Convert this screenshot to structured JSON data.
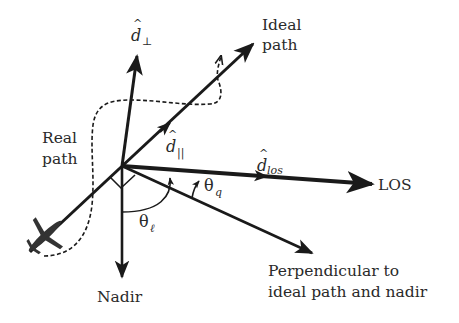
{
  "diagram": {
    "colors": {
      "stroke": "#1a1a1a",
      "text": "#2a2a2a",
      "background": "#ffffff"
    },
    "labels": {
      "ideal_path_line1": "Ideal",
      "ideal_path_line2": "path",
      "real_path_line1": "Real",
      "real_path_line2": "path",
      "d_perp_base": "d",
      "d_perp_hat": "^",
      "d_perp_sub": "⊥",
      "d_par_base": "d",
      "d_par_hat": "^",
      "d_par_sub": "||",
      "d_los_base": "d",
      "d_los_hat": "^",
      "d_los_sub": "los",
      "los": "LOS",
      "theta_q_base": "θ",
      "theta_q_sub": "q",
      "theta_l_base": "θ",
      "theta_l_sub": "ℓ",
      "nadir": "Nadir",
      "perpendicular_line1": "Perpendicular to",
      "perpendicular_line2": "ideal path and nadir"
    },
    "elements": [
      {
        "id": "ideal-path-arrow",
        "type": "arrow",
        "style": "solid"
      },
      {
        "id": "real-path-curve",
        "type": "curve",
        "style": "dashed"
      },
      {
        "id": "d-perp-arrow",
        "type": "arrow",
        "style": "solid"
      },
      {
        "id": "d-par-arrowhead",
        "type": "arrowhead",
        "style": "solid"
      },
      {
        "id": "los-arrow",
        "type": "arrow",
        "style": "solid-thick"
      },
      {
        "id": "d-los-arrowhead",
        "type": "arrowhead",
        "style": "solid"
      },
      {
        "id": "perpendicular-arrow",
        "type": "arrow",
        "style": "solid"
      },
      {
        "id": "nadir-arrow",
        "type": "arrow",
        "style": "solid"
      },
      {
        "id": "theta-l-arc",
        "type": "arc"
      },
      {
        "id": "theta-q-arc",
        "type": "arc"
      },
      {
        "id": "right-angle-marks",
        "type": "marker"
      },
      {
        "id": "airplane-icon",
        "type": "icon"
      }
    ]
  }
}
